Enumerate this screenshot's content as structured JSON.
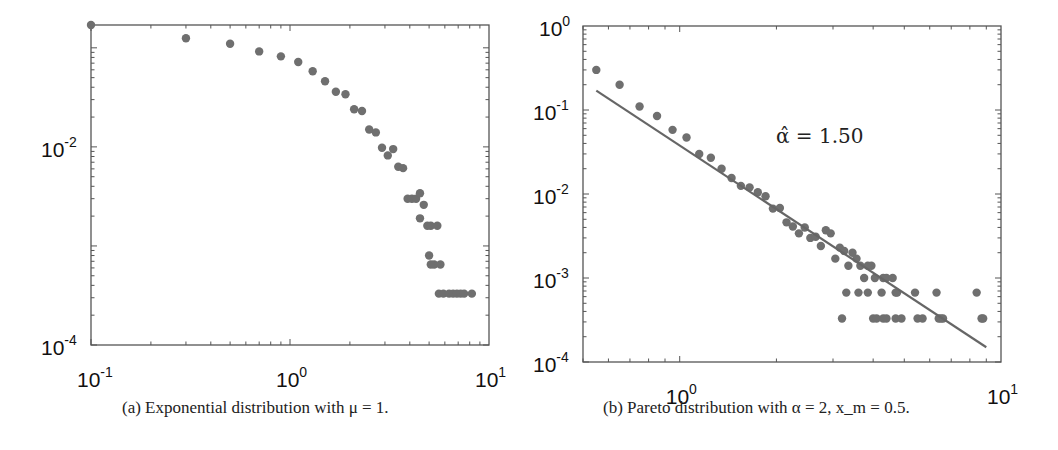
{
  "chart_data": [
    {
      "id": "a",
      "type": "scatter",
      "title": "",
      "caption": "(a) Exponential distribution with μ = 1.",
      "xlabel": "",
      "ylabel": "",
      "xscale": "log",
      "yscale": "log",
      "xlim": [
        0.1,
        10
      ],
      "ylim": [
        0.0001,
        0.17
      ],
      "xticks": [
        {
          "base": "10",
          "exp": "-1",
          "value": 0.1
        },
        {
          "base": "10",
          "exp": "0",
          "value": 1
        },
        {
          "base": "10",
          "exp": "1",
          "value": 10
        }
      ],
      "yticks": [
        {
          "base": "10",
          "exp": "-2",
          "value": 0.01
        },
        {
          "base": "10",
          "exp": "-4",
          "value": 0.0001
        }
      ],
      "grid": false,
      "marker_color": "#6f6f6f",
      "series": [
        {
          "name": "empirical",
          "x": [
            0.1,
            0.3,
            0.5,
            0.7,
            0.9,
            1.1,
            1.3,
            1.5,
            1.7,
            1.9,
            2.1,
            2.3,
            2.5,
            2.7,
            2.9,
            3.1,
            3.3,
            3.5,
            3.7,
            3.9,
            4.1,
            4.3,
            4.5,
            4.7,
            4.5,
            4.9,
            5.1,
            5.5,
            5.0,
            5.3,
            5.7,
            5.1,
            5.6,
            5.9,
            6.3,
            6.6,
            6.9,
            7.2,
            7.5,
            8.2
          ],
          "y": [
            0.17,
            0.125,
            0.11,
            0.092,
            0.082,
            0.072,
            0.058,
            0.046,
            0.036,
            0.034,
            0.024,
            0.023,
            0.015,
            0.014,
            0.0098,
            0.0082,
            0.0095,
            0.0063,
            0.0061,
            0.003,
            0.003,
            0.003,
            0.0034,
            0.0026,
            0.0019,
            0.0016,
            0.0016,
            0.0016,
            0.0008,
            0.00065,
            0.00065,
            0.00065,
            0.00033,
            0.00033,
            0.00033,
            0.00033,
            0.00033,
            0.00033,
            0.00033,
            0.00033
          ]
        }
      ]
    },
    {
      "id": "b",
      "type": "scatter",
      "title": "",
      "caption": "(b) Pareto distribution with α = 2, x_m = 0.5.",
      "xlabel": "",
      "ylabel": "",
      "xscale": "log",
      "yscale": "log",
      "xlim": [
        0.5,
        10
      ],
      "ylim": [
        0.0001,
        1
      ],
      "xticks": [
        {
          "base": "10",
          "exp": "0",
          "value": 1
        },
        {
          "base": "10",
          "exp": "1",
          "value": 10
        }
      ],
      "yticks": [
        {
          "base": "10",
          "exp": "0",
          "value": 1
        },
        {
          "base": "10",
          "exp": "-1",
          "value": 0.1
        },
        {
          "base": "10",
          "exp": "-2",
          "value": 0.01
        },
        {
          "base": "10",
          "exp": "-3",
          "value": 0.001
        },
        {
          "base": "10",
          "exp": "-4",
          "value": 0.0001
        }
      ],
      "grid": false,
      "marker_color": "#6f6f6f",
      "annotation": "α̂ = 1.50",
      "series": [
        {
          "name": "empirical",
          "x": [
            0.55,
            0.65,
            0.75,
            0.85,
            0.95,
            1.05,
            1.15,
            1.25,
            1.35,
            1.45,
            1.55,
            1.65,
            1.75,
            1.85,
            1.95,
            2.05,
            2.15,
            2.25,
            2.35,
            2.45,
            2.55,
            2.65,
            2.75,
            2.85,
            2.95,
            3.05,
            3.15,
            3.25,
            3.35,
            3.45,
            3.55,
            3.65,
            3.75,
            3.85,
            3.95,
            4.05,
            4.3,
            4.4,
            4.6,
            3.3,
            3.6,
            3.85,
            4.25,
            4.7,
            4.75,
            5.4,
            6.3,
            8.4,
            3.2,
            4.0,
            4.1,
            4.3,
            4.4,
            4.7,
            4.9,
            5.5,
            5.7,
            6.4,
            6.5,
            6.6,
            8.7,
            8.8
          ],
          "y": [
            0.3,
            0.2,
            0.11,
            0.085,
            0.058,
            0.047,
            0.03,
            0.027,
            0.02,
            0.0155,
            0.0125,
            0.012,
            0.0105,
            0.0094,
            0.0067,
            0.0068,
            0.0046,
            0.0041,
            0.0034,
            0.004,
            0.003,
            0.0031,
            0.0024,
            0.0037,
            0.0034,
            0.0017,
            0.0023,
            0.0021,
            0.0014,
            0.002,
            0.0017,
            0.0014,
            0.001,
            0.0014,
            0.0014,
            0.001,
            0.001,
            0.001,
            0.001,
            0.00067,
            0.00067,
            0.00067,
            0.00067,
            0.00067,
            0.00067,
            0.00067,
            0.00067,
            0.00067,
            0.00033,
            0.00033,
            0.00033,
            0.00033,
            0.00033,
            0.00033,
            0.00033,
            0.00033,
            0.00033,
            0.00033,
            0.00033,
            0.00033,
            0.00033,
            0.00033
          ]
        },
        {
          "name": "fit",
          "type": "line",
          "x": [
            0.55,
            9.0
          ],
          "y": [
            0.17,
            0.00015
          ]
        }
      ]
    }
  ]
}
